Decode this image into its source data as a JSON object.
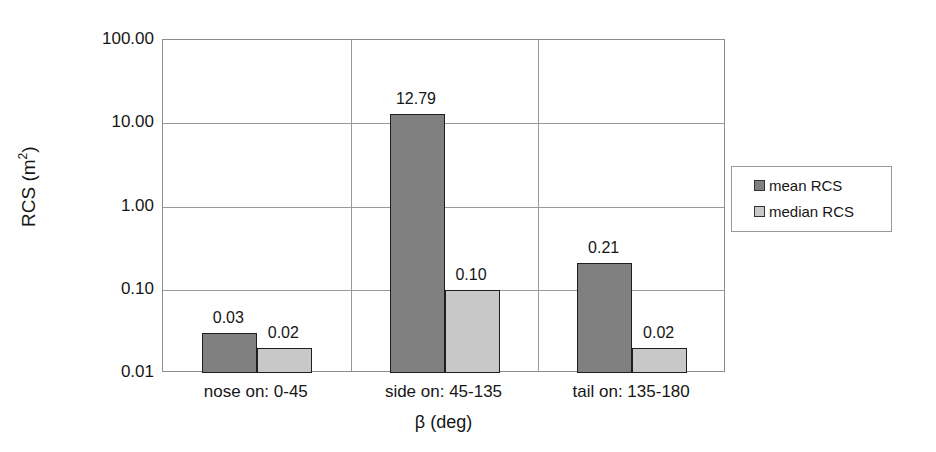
{
  "chart_data": {
    "type": "bar",
    "title": "",
    "subtitle": "",
    "xlabel": "β (deg)",
    "ylabel": "RCS (m²)",
    "ylabel_base": "RCS (m",
    "ylabel_exponent": "2",
    "ylabel_tail": ")",
    "yscale": "log",
    "ylim": [
      0.01,
      100
    ],
    "grid": "horizontal-and-category-separators",
    "legend_position": "right-outside",
    "categories": [
      "nose on:  0-45",
      "side on: 45-135",
      "tail on: 135-180"
    ],
    "series": [
      {
        "name": "mean RCS",
        "color": "#808080",
        "values": [
          0.03,
          12.79,
          0.21
        ],
        "labels": [
          "0.03",
          "12.79",
          "0.21"
        ]
      },
      {
        "name": "median RCS",
        "color": "#c8c8c8",
        "values": [
          0.02,
          0.1,
          0.02
        ],
        "labels": [
          "0.02",
          "0.10",
          "0.02"
        ]
      }
    ],
    "yticks": [
      {
        "value": 100,
        "label": "100.00"
      },
      {
        "value": 10,
        "label": "10.00"
      },
      {
        "value": 1,
        "label": "1.00"
      },
      {
        "value": 0.1,
        "label": "0.10"
      },
      {
        "value": 0.01,
        "label": "0.01"
      }
    ]
  },
  "legend": {
    "entries": [
      {
        "label": "mean RCS",
        "color": "#808080"
      },
      {
        "label": "median RCS",
        "color": "#c8c8c8"
      }
    ]
  },
  "colors": {
    "mean": "#808080",
    "median": "#c8c8c8",
    "grid": "#9a9a9a",
    "axis": "#8c8c8c",
    "text": "#161616",
    "background": "#ffffff"
  }
}
